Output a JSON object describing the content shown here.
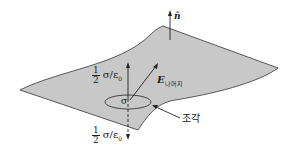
{
  "diagram": {
    "normal_label": "n̂",
    "upper_field": {
      "fraction_num": "1",
      "fraction_den": "2",
      "expr": "σ/ε",
      "expr_sub": "0"
    },
    "lower_field": {
      "fraction_num": "1",
      "fraction_den": "2",
      "expr": "σ/ε",
      "expr_sub": "0"
    },
    "rest_field": {
      "symbol": "E",
      "subscript": "나머지"
    },
    "patch_symbol": "σ",
    "patch_label": "조각"
  },
  "colors": {
    "surface_fill": "#c8c8c8",
    "outline": "#333333"
  }
}
